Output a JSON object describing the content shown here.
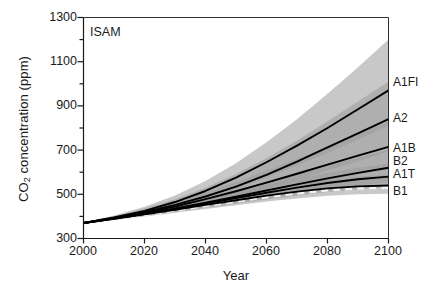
{
  "chart_data": {
    "type": "line",
    "title": "",
    "panel_label": "ISAM",
    "xlabel": "Year",
    "ylabel_main": "CO",
    "ylabel_sub": "2",
    "ylabel_rest": " concentration (ppm)",
    "xlim": [
      2000,
      2100
    ],
    "ylim": [
      300,
      1300
    ],
    "grid": false,
    "legend_position": "right-inline-labels",
    "xticks": [
      2000,
      2020,
      2040,
      2060,
      2080,
      2100
    ],
    "yticks": [
      300,
      500,
      700,
      900,
      1100,
      1300
    ],
    "yticks_minor": [
      400,
      600,
      800,
      1000,
      1200
    ],
    "x": [
      2000,
      2010,
      2020,
      2030,
      2040,
      2050,
      2060,
      2070,
      2080,
      2090,
      2100
    ],
    "series": [
      {
        "name": "A1FI",
        "label": "A1FI",
        "color": "#000000",
        "style": "solid",
        "values": [
          370,
          395,
          425,
          465,
          515,
          575,
          645,
          720,
          800,
          885,
          970
        ],
        "band_upper": [
          372,
          404,
          444,
          495,
          560,
          640,
          735,
          840,
          955,
          1075,
          1200
        ],
        "band_lower": [
          368,
          388,
          412,
          442,
          480,
          525,
          576,
          630,
          688,
          748,
          810
        ]
      },
      {
        "name": "A2",
        "label": "A2",
        "color": "#000000",
        "style": "solid",
        "values": [
          370,
          393,
          420,
          452,
          490,
          535,
          588,
          648,
          712,
          776,
          840
        ],
        "band_upper": [
          372,
          401,
          436,
          478,
          530,
          592,
          664,
          744,
          830,
          920,
          1010
        ],
        "band_lower": [
          368,
          387,
          408,
          432,
          460,
          492,
          528,
          566,
          608,
          650,
          694
        ]
      },
      {
        "name": "A1B",
        "label": "A1B",
        "color": "#000000",
        "style": "solid",
        "values": [
          370,
          392,
          417,
          445,
          478,
          514,
          553,
          593,
          634,
          675,
          715
        ],
        "band_upper": [
          372,
          399,
          430,
          466,
          508,
          555,
          606,
          660,
          716,
          772,
          830
        ],
        "band_lower": [
          368,
          386,
          406,
          428,
          452,
          478,
          505,
          533,
          561,
          589,
          616
        ]
      },
      {
        "name": "B2",
        "label": "B2",
        "color": "#000000",
        "style": "solid",
        "values": [
          370,
          390,
          412,
          436,
          462,
          489,
          517,
          545,
          572,
          597,
          620
        ],
        "band_upper": [
          372,
          396,
          423,
          453,
          486,
          521,
          558,
          595,
          632,
          667,
          700
        ],
        "band_lower": [
          368,
          385,
          403,
          422,
          442,
          462,
          482,
          502,
          521,
          539,
          556
        ]
      },
      {
        "name": "A1T",
        "label": "A1T",
        "color": "#000000",
        "style": "solid",
        "values": [
          370,
          390,
          411,
          434,
          458,
          483,
          507,
          530,
          551,
          568,
          580
        ],
        "band_upper": [
          372,
          396,
          421,
          449,
          479,
          510,
          541,
          570,
          597,
          620,
          638
        ],
        "band_lower": [
          368,
          385,
          402,
          420,
          439,
          458,
          476,
          494,
          510,
          523,
          533
        ]
      },
      {
        "name": "B1",
        "label": "B1",
        "color": "#000000",
        "style": "solid",
        "values": [
          370,
          389,
          409,
          430,
          452,
          473,
          494,
          512,
          527,
          536,
          540
        ],
        "band_upper": [
          372,
          395,
          419,
          444,
          471,
          497,
          523,
          546,
          566,
          580,
          588
        ],
        "band_lower": [
          368,
          384,
          400,
          417,
          434,
          451,
          467,
          481,
          493,
          500,
          503
        ]
      }
    ],
    "overlay_dashed": {
      "name": "dashed-reference",
      "color": "#f2f2f2",
      "style": "dashed",
      "values": [
        370,
        388,
        407,
        427,
        448,
        468,
        488,
        505,
        519,
        528,
        531
      ]
    },
    "band_color": "#9a9a9a",
    "band_opacity": 0.55,
    "axis_color": "#1a1a1a"
  }
}
